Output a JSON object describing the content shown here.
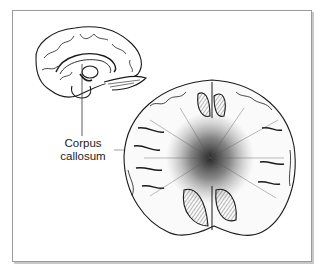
{
  "figure": {
    "labels": [
      {
        "id": "corpus-callosum",
        "line1": "Corpus",
        "line2": "callosum"
      }
    ],
    "colors": {
      "ink": "#1a1a1a",
      "frame": "#9a9a9a",
      "background": "#ffffff"
    }
  }
}
